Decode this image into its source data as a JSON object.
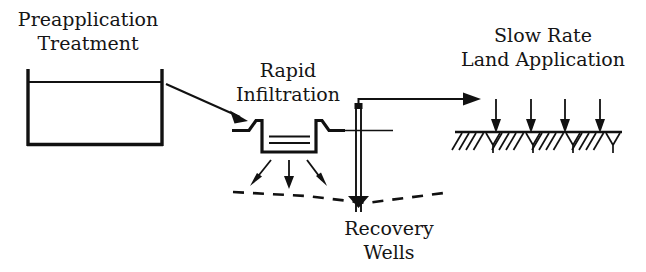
{
  "diagram": {
    "background_color": "#ffffff",
    "ink_color": "#111111",
    "stages": [
      {
        "id": "preapplication-treatment",
        "label_line1": "Preapplication",
        "label_line2": "Treatment",
        "icon": "open-rectangular-tank-with-water-level"
      },
      {
        "id": "rapid-infiltration",
        "label_line1": "Rapid",
        "label_line2": "Infiltration",
        "icon": "trapezoidal-infiltration-basin-with-berms"
      },
      {
        "id": "recovery-wells",
        "label_line1": "Recovery",
        "label_line2": "Wells",
        "icon": "vertical-well-casing-with-pump-riser"
      },
      {
        "id": "slow-rate-land-application",
        "label_line1": "Slow Rate",
        "label_line2": "Land Application",
        "icon": "hatched-ground-surface-with-application-arrows"
      }
    ],
    "flow_arrows": [
      {
        "id": "tank-to-basin",
        "from": "preapplication-treatment",
        "to": "rapid-infiltration",
        "direction": "down-right-diagonal"
      },
      {
        "id": "wells-to-land-application",
        "from": "recovery-wells",
        "to": "slow-rate-land-application",
        "direction": "right-horizontal-via-riser"
      }
    ],
    "percolation_arrows": {
      "id": "basin-percolation",
      "count": 3,
      "direction": "downward-spreading",
      "target": "groundwater-table"
    },
    "application_arrows": {
      "id": "land-application-sprinkling",
      "count": 4,
      "direction": "downward",
      "target": "ground-surface"
    },
    "groundwater_table": {
      "id": "groundwater-table",
      "style": "dashed",
      "shape": "drawdown-cone-toward-well"
    }
  }
}
